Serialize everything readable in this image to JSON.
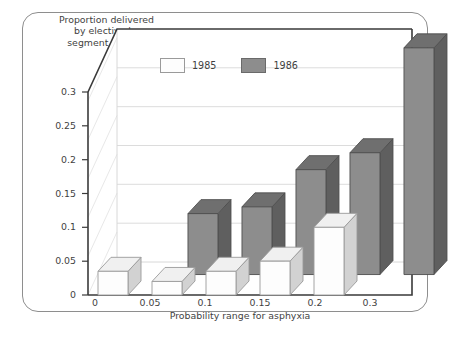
{
  "chart_data": {
    "type": "bar",
    "title": "",
    "ylabel": "Proportion delivered by elective lower segment cesarean section",
    "xlabel": "Probability range for asphyxia",
    "categories": [
      "0",
      "0.05",
      "0.1",
      "0.15",
      "0.2",
      "0.3"
    ],
    "yticks": [
      "0",
      "0.05",
      "0.1",
      "0.15",
      "0.2",
      "0.25",
      "0.3"
    ],
    "ylim": [
      0,
      0.3
    ],
    "grid": true,
    "legend_position": "top-center",
    "projection": "3d",
    "series": [
      {
        "name": "1985",
        "color": "#fdfdfd",
        "values": [
          0.035,
          0.02,
          0.035,
          0.05,
          0.1,
          null
        ]
      },
      {
        "name": "1986",
        "color": "#8d8d8d",
        "values": [
          null,
          0.09,
          0.1,
          0.155,
          0.18,
          0.335
        ]
      }
    ]
  },
  "axis_title_lines": [
    "Proportion delivered",
    "by elective lower",
    "segment cesarean",
    "section"
  ],
  "legend": {
    "items": [
      {
        "label": "1985",
        "swatch": "white-swatch-icon"
      },
      {
        "label": "1986",
        "swatch": "gray-swatch-icon"
      }
    ]
  },
  "colors": {
    "bar_1985_front": "#fdfdfd",
    "bar_1985_top": "#f0f0f0",
    "bar_1985_side": "#d2d2d2",
    "bar_1986_front": "#8d8d8d",
    "bar_1986_top": "#6f6f6f",
    "bar_1986_side": "#5f5f5f",
    "frame": "#8e8e8e",
    "gridline": "#dcdcdc",
    "axis": "#3a3a3a",
    "text": "#3f3f3f"
  }
}
